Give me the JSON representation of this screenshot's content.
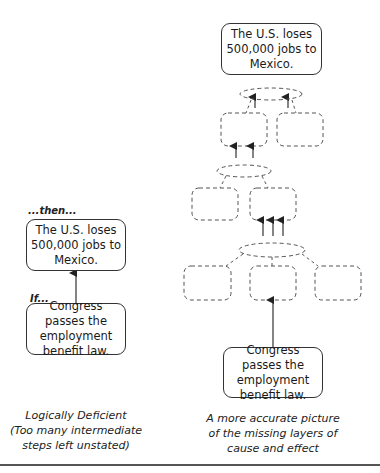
{
  "left_diagram": {
    "then_label": "...then...",
    "effect_box": "The U.S. loses 500,000 jobs to Mexico.",
    "if_label": "If...",
    "cause_box": "Congress passes the employment benefit law.",
    "caption_line1": "Logically Deficient",
    "caption_line2": "(Too many intermediate",
    "caption_line3": "steps left unstated)"
  },
  "right_diagram": {
    "effect_box": "The U.S. loses 500,000 jobs to Mexico.",
    "cause_box": "Congress passes the employment benefit law.",
    "caption_line1": "A more accurate picture",
    "caption_line2": "of the missing layers of",
    "caption_line3": "cause and effect",
    "intermediate_rows": [
      2,
      2,
      3
    ]
  },
  "colors": {
    "line": "#333333",
    "dashed": "#555555",
    "rule": "#555555"
  }
}
